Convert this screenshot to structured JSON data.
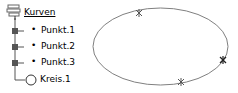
{
  "tree": {
    "root": {
      "label": "Kurven",
      "icon": "curves-root-icon"
    },
    "items": [
      {
        "label": "Punkt.1",
        "icon": "point-icon"
      },
      {
        "label": "Punkt.2",
        "icon": "point-icon"
      },
      {
        "label": "Punkt.3",
        "icon": "point-icon"
      },
      {
        "label": "Kreis.1",
        "icon": "circle-icon"
      }
    ]
  },
  "canvas": {
    "shape": "circle-through-3-points",
    "stroke_color": "#808080",
    "points": [
      {
        "name": "Punkt.1",
        "x": 139,
        "y": 13
      },
      {
        "name": "Punkt.2",
        "x": 223,
        "y": 60
      },
      {
        "name": "Punkt.3",
        "x": 181,
        "y": 82
      }
    ]
  }
}
